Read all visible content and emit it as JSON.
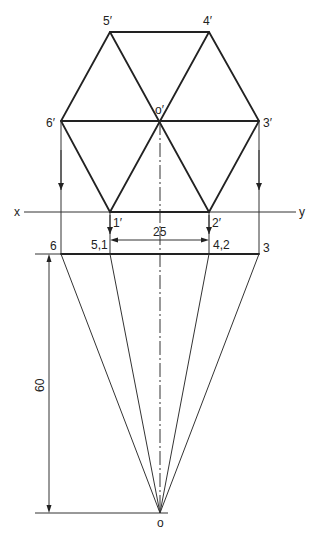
{
  "diagram": {
    "type": "orthographic-projection",
    "colors": {
      "line": "#222222",
      "background": "#ffffff"
    },
    "ref_line": {
      "left_label": "x",
      "right_label": "y"
    },
    "front_view_labels": {
      "p5": "5′",
      "p4": "4′",
      "p6": "6′",
      "o": "o′",
      "p3": "3′",
      "p1": "1′",
      "p2": "2′"
    },
    "top_view_labels": {
      "p6": "6",
      "p51": "5,1",
      "p42": "4,2",
      "p3": "3",
      "o": "o"
    },
    "dimensions": {
      "side": "25",
      "height": "60"
    },
    "points": {
      "p5f": [
        110,
        32
      ],
      "p4f": [
        209,
        32
      ],
      "p6f": [
        61,
        121
      ],
      "of": [
        160,
        121
      ],
      "p3f": [
        259,
        121
      ],
      "p1f": [
        110,
        212
      ],
      "p2f": [
        209,
        212
      ],
      "t6": [
        61,
        254
      ],
      "t51": [
        110,
        254
      ],
      "t42": [
        209,
        254
      ],
      "t3": [
        259,
        254
      ],
      "to": [
        160,
        513
      ]
    }
  }
}
